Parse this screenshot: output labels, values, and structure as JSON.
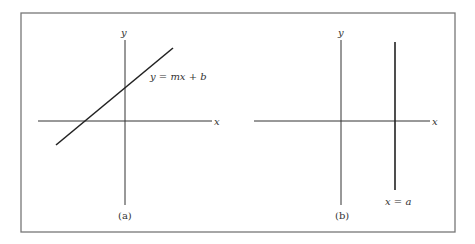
{
  "figure": {
    "panels": [
      {
        "id": "a",
        "caption": "(a)",
        "x_axis_label": "x",
        "y_axis_label": "y",
        "line_label": "y = mx + b",
        "line_type": "slanted"
      },
      {
        "id": "b",
        "caption": "(b)",
        "x_axis_label": "x",
        "y_axis_label": "y",
        "line_label": "x = a",
        "line_type": "vertical"
      }
    ],
    "colors": {
      "frame": "#666666",
      "lines": "#222222",
      "text": "#333333"
    }
  }
}
